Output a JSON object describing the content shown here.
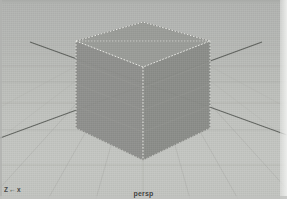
{
  "viewport": {
    "camera_label": "persp",
    "axis_indicator": {
      "z_label": "Z",
      "arrow": "←",
      "x_label": "x"
    },
    "background_color": "#b9bbb8",
    "grid_color": "#9fa19d",
    "axis_color": "#575a56",
    "selection_color": "#f2f2ee"
  },
  "scene": {
    "object_name": "pCube1",
    "object_state": "selected",
    "shading_mode": "smooth-shaded",
    "faces": {
      "top_color": "#9a9c98",
      "left_color": "#8e908c",
      "right_color": "#8a8c88"
    }
  }
}
